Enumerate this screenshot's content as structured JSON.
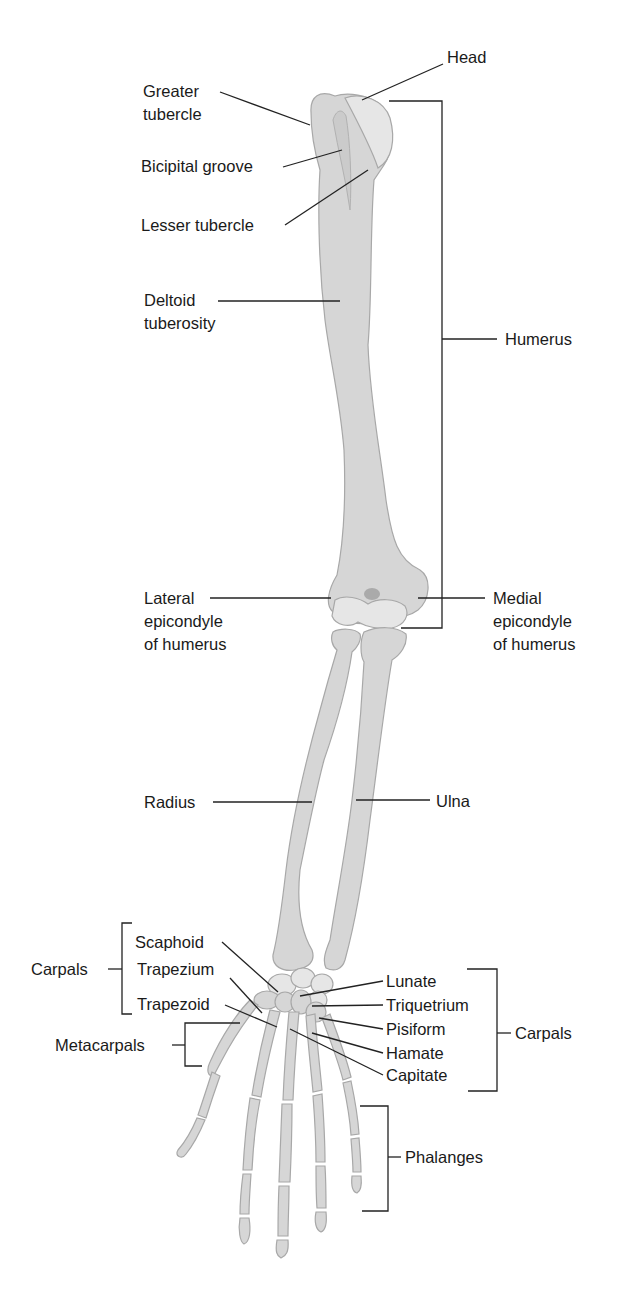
{
  "diagram": {
    "colors": {
      "bone": "#d6d6d6",
      "bone_light": "#e6e6e6",
      "bone_outline": "#a8a8a8",
      "line": "#222222",
      "text": "#1a1a1a",
      "background": "#ffffff"
    },
    "labels": {
      "head": "Head",
      "greater_tubercle": "Greater\ntubercle",
      "bicipital_groove": "Bicipital groove",
      "lesser_tubercle": "Lesser tubercle",
      "deltoid_tuberosity": "Deltoid\ntuberosity",
      "humerus": "Humerus",
      "lateral_epicondyle": "Lateral\nepicondyle\nof humerus",
      "medial_epicondyle": "Medial\nepicondyle\nof humerus",
      "radius": "Radius",
      "ulna": "Ulna",
      "carpals_left": "Carpals",
      "scaphoid": "Scaphoid",
      "trapezium": "Trapezium",
      "trapezoid": "Trapezoid",
      "metacarpals": "Metacarpals",
      "lunate": "Lunate",
      "triquetrium": "Triquetrium",
      "pisiform": "Pisiform",
      "hamate": "Hamate",
      "capitate": "Capitate",
      "carpals_right": "Carpals",
      "phalanges": "Phalanges"
    }
  }
}
